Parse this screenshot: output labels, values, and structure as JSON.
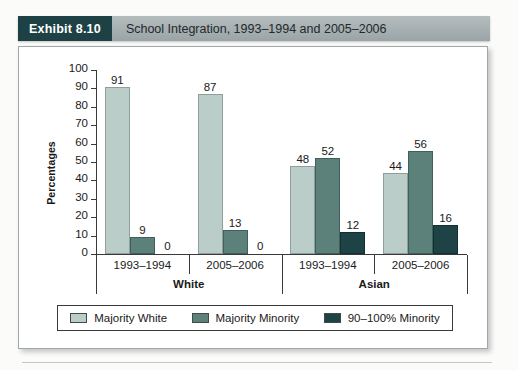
{
  "header": {
    "tag": "Exhibit 8.10",
    "title": "School Integration, 1993–1994 and 2005–2006"
  },
  "chart_data": {
    "type": "bar",
    "title": "School Integration, 1993–1994 and 2005–2006",
    "xlabel": "",
    "ylabel": "Percentages",
    "ylim": [
      0,
      100
    ],
    "ytick_step": 10,
    "yticks": [
      0,
      10,
      20,
      30,
      40,
      50,
      60,
      70,
      80,
      90,
      100
    ],
    "grid": false,
    "legend_position": "bottom",
    "categories": [
      "1993–1994",
      "2005–2006",
      "1993–1994",
      "2005–2006"
    ],
    "group_labels": [
      "White",
      "Asian"
    ],
    "groups": [
      {
        "label": "White",
        "periods": [
          {
            "label": "1993–1994",
            "values": [
              91,
              9,
              0
            ]
          },
          {
            "label": "2005–2006",
            "values": [
              87,
              13,
              0
            ]
          }
        ]
      },
      {
        "label": "Asian",
        "periods": [
          {
            "label": "1993–1994",
            "values": [
              48,
              52,
              12
            ]
          },
          {
            "label": "2005–2006",
            "values": [
              44,
              56,
              16
            ]
          }
        ]
      }
    ],
    "series": [
      {
        "name": "Majority White",
        "color": "#bacdc9",
        "values": [
          91,
          87,
          48,
          44
        ]
      },
      {
        "name": "Majority Minority",
        "color": "#5c817b",
        "values": [
          9,
          13,
          52,
          56
        ]
      },
      {
        "name": "90–100% Minority",
        "color": "#1d4346",
        "values": [
          0,
          0,
          12,
          16
        ]
      }
    ],
    "legend": [
      {
        "label": "Majority White",
        "color": "#bacdc9"
      },
      {
        "label": "Majority Minority",
        "color": "#5c817b"
      },
      {
        "label": "90–100% Minority",
        "color": "#1d4346"
      }
    ]
  },
  "colors": {
    "tag_background": "#1d4145",
    "header_band": "#a6afb1",
    "series_light": "#bacdc9",
    "series_medium": "#5c817b",
    "series_dark": "#1d4346",
    "axis": "#3a3a3a"
  }
}
